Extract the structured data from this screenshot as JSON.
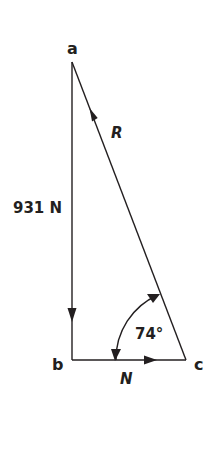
{
  "diagram": {
    "type": "force-vector-triangle",
    "vertices": [
      {
        "id": "a",
        "label": "a",
        "x": 72,
        "y": 62
      },
      {
        "id": "b",
        "label": "b",
        "x": 72,
        "y": 360
      },
      {
        "id": "c",
        "label": "c",
        "x": 186,
        "y": 360
      }
    ],
    "vectors": [
      {
        "id": "weight",
        "from": "a",
        "to": "b",
        "label": "931 N",
        "direction": "down"
      },
      {
        "id": "N",
        "from": "b",
        "to": "c",
        "label": "N",
        "direction": "right"
      },
      {
        "id": "R",
        "from": "c",
        "to": "a",
        "label": "R",
        "direction": "up-left"
      }
    ],
    "angle": {
      "vertex": "c",
      "label": "74°",
      "value": 74,
      "unit": "degrees"
    },
    "colors": {
      "line": "#231f20",
      "background": "#ffffff"
    }
  },
  "labels": {
    "a": "a",
    "b": "b",
    "c": "c",
    "weight": "931 N",
    "R": "R",
    "N": "N",
    "angle": "74°"
  }
}
